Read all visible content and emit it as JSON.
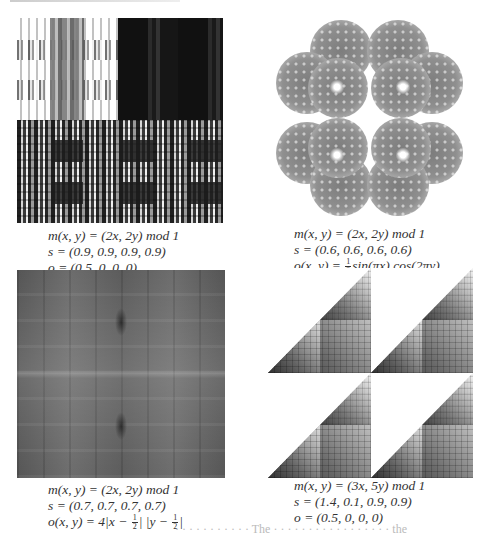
{
  "figure": {
    "panels": [
      {
        "id": "a",
        "description": "plaid-like fractal (dark/white blocks)",
        "caption": {
          "m": "m(x, y) = (2x, 2y) mod 1",
          "s": "s = (0.9, 0.9, 0.9, 0.9)",
          "o": "o = (0.5, 0, 0, 0)"
        }
      },
      {
        "id": "b",
        "description": "gray circular cloud fractal",
        "caption": {
          "m": "m(x, y) = (2x, 2y) mod 1",
          "s": "s = (0.6, 0.6, 0.6, 0.6)",
          "o_prefix": "o(x, y) = ",
          "o_frac_num": "1",
          "o_frac_den": "2",
          "o_suffix": "sin(πx) cos(2πy)"
        }
      },
      {
        "id": "c",
        "description": "dark gray smooth gradient fractal",
        "caption": {
          "m": "m(x, y) = (2x, 2y) mod 1",
          "s": "s = (0.7, 0.7, 0.7, 0.7)",
          "o_prefix": "o(x, y) = 4|x − ",
          "o_frac1_num": "1",
          "o_frac1_den": "2",
          "o_mid": "| |y − ",
          "o_frac2_num": "1",
          "o_frac2_den": "2",
          "o_suffix": "|"
        }
      },
      {
        "id": "d",
        "description": "Sierpinski-like triangular shaded fractal",
        "caption": {
          "m": "m(x, y) = (3x, 5y) mod 1",
          "s": "s = (1.4, 0.1, 0.9, 0.9)",
          "o": "o = (0.5, 0, 0, 0)"
        }
      }
    ],
    "cut_text": "· · · · · · · · · · ·  The  · · · · · · · · · · · · · · · · · the"
  }
}
